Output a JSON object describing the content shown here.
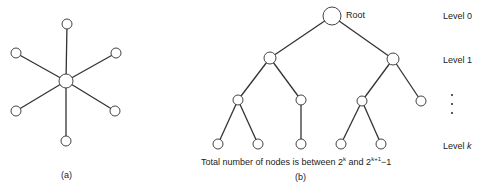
{
  "figure_a": {
    "caption": "(a)",
    "center": {
      "x": 66,
      "y": 81,
      "r": 7
    },
    "leaves": [
      {
        "x": 67,
        "y": 24
      },
      {
        "x": 116,
        "y": 53
      },
      {
        "x": 115,
        "y": 111
      },
      {
        "x": 66,
        "y": 141
      },
      {
        "x": 16,
        "y": 111
      },
      {
        "x": 16,
        "y": 53
      }
    ],
    "leaf_radius": 5
  },
  "figure_b": {
    "caption": "(b)",
    "root_label": "Root",
    "summary": "Total number of nodes is between 2",
    "summary_exp1": "k",
    "summary_mid": " and 2",
    "summary_exp2": "k+1",
    "summary_end": "−1",
    "levels": {
      "level0": "Level 0",
      "level1": "Level 1",
      "levelk_prefix": "Level ",
      "levelk_var": "k"
    },
    "nodes": [
      {
        "id": "root",
        "x": 332,
        "y": 16,
        "r": 9
      },
      {
        "id": "l1a",
        "x": 270,
        "y": 58,
        "r": 6
      },
      {
        "id": "l1b",
        "x": 393,
        "y": 59,
        "r": 6
      },
      {
        "id": "l2a",
        "x": 238,
        "y": 100,
        "r": 5
      },
      {
        "id": "l2b",
        "x": 301,
        "y": 100,
        "r": 5
      },
      {
        "id": "l2c",
        "x": 362,
        "y": 101,
        "r": 5
      },
      {
        "id": "l2d",
        "x": 421,
        "y": 101,
        "r": 5
      },
      {
        "id": "l3a",
        "x": 218,
        "y": 144,
        "r": 5
      },
      {
        "id": "l3b",
        "x": 258,
        "y": 144,
        "r": 5
      },
      {
        "id": "l3c",
        "x": 301,
        "y": 144,
        "r": 5
      },
      {
        "id": "l3d",
        "x": 341,
        "y": 144,
        "r": 5
      },
      {
        "id": "l3e",
        "x": 381,
        "y": 144,
        "r": 5
      }
    ],
    "edges": [
      [
        "root",
        "l1a"
      ],
      [
        "root",
        "l1b"
      ],
      [
        "l1a",
        "l2a"
      ],
      [
        "l1a",
        "l2b"
      ],
      [
        "l1b",
        "l2c"
      ],
      [
        "l1b",
        "l2d"
      ],
      [
        "l2a",
        "l3a"
      ],
      [
        "l2a",
        "l3b"
      ],
      [
        "l2b",
        "l3c"
      ],
      [
        "l2c",
        "l3d"
      ],
      [
        "l2c",
        "l3e"
      ]
    ]
  }
}
